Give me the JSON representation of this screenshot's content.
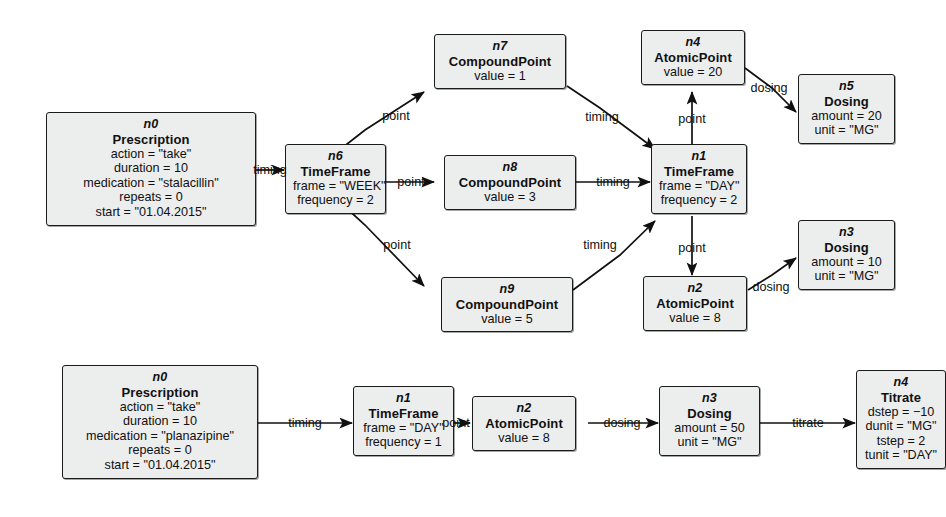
{
  "diagram": {
    "style": {
      "node_fill": "#eceded",
      "node_border": "#1b1b1b",
      "edge_color": "#101010",
      "background": "#ffffff"
    },
    "graphs": [
      {
        "name": "stalacillin-prescription",
        "nodes": [
          {
            "key": "g1n0",
            "id": "n0",
            "type": "Prescription",
            "attrs": [
              "action = \"take\"",
              "duration = 10",
              "medication = \"stalacillin\"",
              "repeats = 0",
              "start = \"01.04.2015\""
            ]
          },
          {
            "key": "g1n6",
            "id": "n6",
            "type": "TimeFrame",
            "attrs": [
              "frame = \"WEEK\"",
              "frequency = 2"
            ]
          },
          {
            "key": "g1n7",
            "id": "n7",
            "type": "CompoundPoint",
            "attrs": [
              "value = 1"
            ]
          },
          {
            "key": "g1n8",
            "id": "n8",
            "type": "CompoundPoint",
            "attrs": [
              "value = 3"
            ]
          },
          {
            "key": "g1n9",
            "id": "n9",
            "type": "CompoundPoint",
            "attrs": [
              "value = 5"
            ]
          },
          {
            "key": "g1n1",
            "id": "n1",
            "type": "TimeFrame",
            "attrs": [
              "frame = \"DAY\"",
              "frequency = 2"
            ]
          },
          {
            "key": "g1n4",
            "id": "n4",
            "type": "AtomicPoint",
            "attrs": [
              "value = 20"
            ]
          },
          {
            "key": "g1n2",
            "id": "n2",
            "type": "AtomicPoint",
            "attrs": [
              "value = 8"
            ]
          },
          {
            "key": "g1n5",
            "id": "n5",
            "type": "Dosing",
            "attrs": [
              "amount = 20",
              "unit = \"MG\""
            ]
          },
          {
            "key": "g1n3",
            "id": "n3",
            "type": "Dosing",
            "attrs": [
              "amount = 10",
              "unit = \"MG\""
            ]
          }
        ],
        "edges": [
          {
            "from": "n0",
            "to": "n6",
            "label": "timing"
          },
          {
            "from": "n6",
            "to": "n7",
            "label": "point"
          },
          {
            "from": "n6",
            "to": "n8",
            "label": "point"
          },
          {
            "from": "n6",
            "to": "n9",
            "label": "point"
          },
          {
            "from": "n7",
            "to": "n1",
            "label": "timing"
          },
          {
            "from": "n8",
            "to": "n1",
            "label": "timing"
          },
          {
            "from": "n9",
            "to": "n1",
            "label": "timing"
          },
          {
            "from": "n1",
            "to": "n4",
            "label": "point"
          },
          {
            "from": "n1",
            "to": "n2",
            "label": "point"
          },
          {
            "from": "n4",
            "to": "n5",
            "label": "dosing"
          },
          {
            "from": "n2",
            "to": "n3",
            "label": "dosing"
          }
        ]
      },
      {
        "name": "planazipine-prescription",
        "nodes": [
          {
            "key": "g2n0",
            "id": "n0",
            "type": "Prescription",
            "attrs": [
              "action = \"take\"",
              "duration = 10",
              "medication = \"planazipine\"",
              "repeats = 0",
              "start = \"01.04.2015\""
            ]
          },
          {
            "key": "g2n1",
            "id": "n1",
            "type": "TimeFrame",
            "attrs": [
              "frame = \"DAY\"",
              "frequency = 1"
            ]
          },
          {
            "key": "g2n2",
            "id": "n2",
            "type": "AtomicPoint",
            "attrs": [
              "value = 8"
            ]
          },
          {
            "key": "g2n3",
            "id": "n3",
            "type": "Dosing",
            "attrs": [
              "amount = 50",
              "unit = \"MG\""
            ]
          },
          {
            "key": "g2n4",
            "id": "n4",
            "type": "Titrate",
            "attrs": [
              "dstep = −10",
              "dunit = \"MG\"",
              "tstep = 2",
              "tunit = \"DAY\""
            ]
          }
        ],
        "edges": [
          {
            "from": "n0",
            "to": "n1",
            "label": "timing"
          },
          {
            "from": "n1",
            "to": "n2",
            "label": "point"
          },
          {
            "from": "n2",
            "to": "n3",
            "label": "dosing"
          },
          {
            "from": "n3",
            "to": "n4",
            "label": "titrate"
          }
        ]
      }
    ],
    "edge_labels": {
      "l1": "timing",
      "l2": "point",
      "l3": "point",
      "l4": "point",
      "l5": "timing",
      "l6": "timing",
      "l7": "timing",
      "l8": "point",
      "l9": "point",
      "l10": "dosing",
      "l11": "dosing",
      "l12": "timing",
      "l13": "point",
      "l14": "dosing",
      "l15": "titrate"
    }
  }
}
